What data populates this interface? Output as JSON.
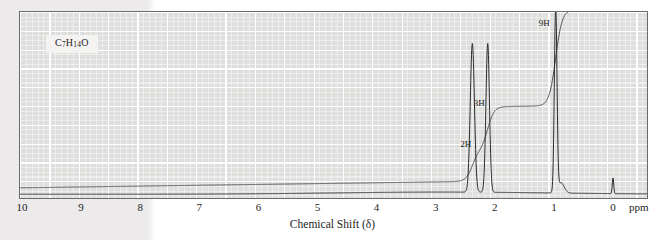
{
  "figure": {
    "name": "proton-nmr-spectrum",
    "formula_text": "C7H14O",
    "formula_parts": [
      {
        "t": "C",
        "sub": false
      },
      {
        "t": "7",
        "sub": true
      },
      {
        "t": "H",
        "sub": false
      },
      {
        "t": "14",
        "sub": true
      },
      {
        "t": "O",
        "sub": false
      }
    ]
  },
  "axis": {
    "title": "Chemical Shift (δ)",
    "unit_label": "ppm",
    "tick_labels": [
      "10",
      "9",
      "8",
      "7",
      "6",
      "5",
      "4",
      "3",
      "2",
      "1",
      "0"
    ],
    "tick_values": [
      10,
      9,
      8,
      7,
      6,
      5,
      4,
      3,
      2,
      1,
      0
    ],
    "xlim": [
      10.05,
      -0.6
    ]
  },
  "annotations": [
    {
      "label": "2H",
      "ppm": 2.45,
      "y_frac": 0.69
    },
    {
      "label": "3H",
      "ppm": 2.22,
      "y_frac": 0.47
    },
    {
      "label": "9H",
      "ppm": 1.12,
      "y_frac": 0.035
    }
  ],
  "colors": {
    "paper": "#ffffff",
    "page_shade": "#eceaea",
    "grid_ground": "#dededd",
    "grid_line": "#ffffff",
    "frame": "#6a6a6a",
    "trace": "#2b2b2b",
    "integral": "#4a4a4a",
    "text": "#1d1d1d"
  },
  "chart_data": {
    "type": "line",
    "title": "",
    "subtitle": "",
    "xlabel": "Chemical Shift (δ)",
    "ylabel": "",
    "xlim": [
      10.05,
      -0.6
    ],
    "ylim": [
      0,
      1
    ],
    "grid": true,
    "legend": false,
    "x_axis_reversed": true,
    "series": [
      {
        "name": "nmr-trace",
        "kind": "spectrum",
        "baseline_y": 0.02,
        "peaks": [
          {
            "ppm": 2.38,
            "height": 0.8,
            "width": 0.035,
            "assignment": "2H"
          },
          {
            "ppm": 2.12,
            "height": 0.8,
            "width": 0.03,
            "assignment": "3H"
          },
          {
            "ppm": 0.97,
            "height": 1.0,
            "width": 0.022,
            "assignment": "9H"
          },
          {
            "ppm": 0.88,
            "height": 0.055,
            "width": 0.055,
            "assignment": ""
          },
          {
            "ppm": 0.0,
            "height": 0.085,
            "width": 0.012,
            "assignment": "TMS"
          }
        ]
      },
      {
        "name": "integration-trace",
        "kind": "integral",
        "start_level": 0.055,
        "steps": [
          {
            "ppm": 2.38,
            "rise": 0.165,
            "protons": 2,
            "label": "2H"
          },
          {
            "ppm": 2.12,
            "rise": 0.235,
            "protons": 3,
            "label": "3H"
          },
          {
            "ppm": 0.97,
            "rise": 0.515,
            "protons": 9,
            "label": "9H"
          }
        ],
        "drift_at_3ppm": 0.035
      }
    ],
    "annotations": [
      {
        "text": "C7H14O",
        "kind": "formula-box"
      },
      {
        "text": "2H",
        "ppm": 2.45
      },
      {
        "text": "3H",
        "ppm": 2.22
      },
      {
        "text": "9H",
        "ppm": 1.12
      }
    ]
  }
}
